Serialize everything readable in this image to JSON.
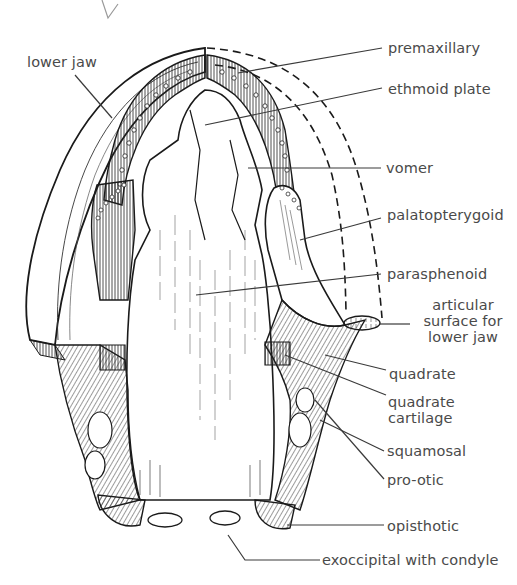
{
  "diagram": {
    "colors": {
      "ink": "#1a1a1a",
      "label": "#4a4a4a",
      "leader": "#3a3a3a",
      "background": "#ffffff"
    },
    "labels": {
      "lower_jaw": "lower jaw",
      "premaxillary": "premaxillary",
      "ethmoid_plate": "ethmoid plate",
      "vomer": "vomer",
      "palatopterygoid": "palatopterygoid",
      "parasphenoid": "parasphenoid",
      "articular_line1": "articular",
      "articular_line2": "surface for",
      "articular_line3": "lower jaw",
      "quadrate": "quadrate",
      "quadrate_cartilage_line1": "quadrate",
      "quadrate_cartilage_line2": "cartilage",
      "squamosal": "squamosal",
      "pro_otic": "pro-otic",
      "opisthotic": "opisthotic",
      "exoccipital": "exoccipital with condyle"
    }
  }
}
